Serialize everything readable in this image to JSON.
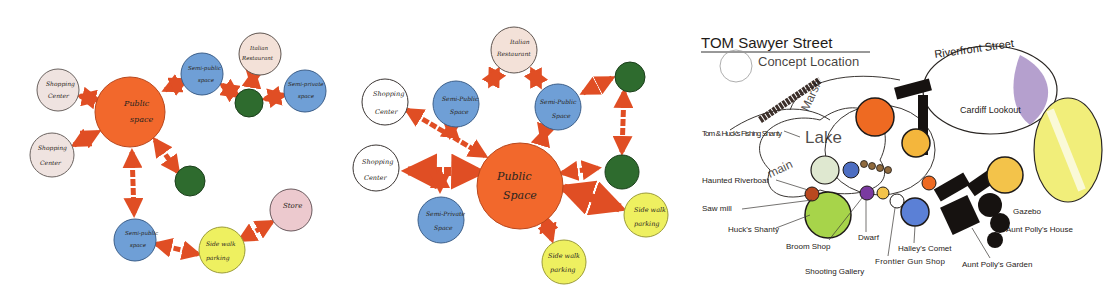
{
  "colors": {
    "public": "#f2682c",
    "semi_public": "#6f9fd6",
    "semi_private": "#6f9fd6",
    "private": "#2e6b2e",
    "shopping": "#efe3e0",
    "restaurant": "#f3e1d8",
    "store": "#ecc9ce",
    "parking": "#eef060",
    "arrow": "#e04e24"
  },
  "panel1": {
    "public": {
      "line1": "Public",
      "line2": "space"
    },
    "shopping_top": {
      "line1": "Shopping",
      "line2": "Center"
    },
    "shopping_bottom": {
      "line1": "Shopping",
      "line2": "Center"
    },
    "semi_public_top": {
      "line1": "Semi-public",
      "line2": "space"
    },
    "restaurant": {
      "line1": "Italian",
      "line2": "Restaurant"
    },
    "semi_private_right": {
      "line1": "Semi-private",
      "line2": "space"
    },
    "semi_public_bottom": {
      "line1": "Semi-public",
      "line2": "space"
    },
    "parking": {
      "line1": "Side walk",
      "line2": "parking"
    },
    "store": {
      "line1": "Store"
    }
  },
  "panel2": {
    "public": {
      "line1": "Public",
      "line2": "Space"
    },
    "restaurant": {
      "line1": "Italian",
      "line2": "Restaurant"
    },
    "shopping_top": {
      "line1": "Shopping",
      "line2": "Center"
    },
    "shopping_bottom": {
      "line1": "Shopping",
      "line2": "Center"
    },
    "semi_public_left": {
      "line1": "Semi-Public",
      "line2": "Space"
    },
    "semi_public_right": {
      "line1": "Semi-Public",
      "line2": "Space"
    },
    "semi_private": {
      "line1": "Semi-Private",
      "line2": "Space"
    },
    "parking_right": {
      "line1": "Side walk",
      "line2": "parking"
    },
    "parking_bottom": {
      "line1": "Side walk",
      "line2": "parking"
    }
  },
  "panel3": {
    "title": "TOM Sawyer Street",
    "subtitle": "Concept Location",
    "labels": {
      "marsh": "Marsh",
      "lake": "Lake",
      "main": "main",
      "riverfront": "Riverfront Street",
      "cardiff": "Cardiff Lookout",
      "fishing": "Tom & Huck's Fishing Shanty",
      "haunted": "Haunted Riverboat",
      "sawmill": "Saw mill",
      "huck": "Huck's Shanty",
      "broom": "Broom Shop",
      "dwarf": "Dwarf",
      "shooting": "Shooting Gallery",
      "frontier": "Frontier Gun Shop",
      "halley": "Halley's Comet",
      "polly_garden": "Aunt Polly's Garden",
      "polly_house": "Aunt Polly's House",
      "gazebo": "Gazebo"
    }
  }
}
